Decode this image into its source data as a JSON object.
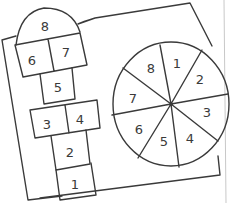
{
  "hopscotch": {
    "squares": [
      {
        "label": "1"
      },
      {
        "label": "2"
      },
      {
        "label": "3"
      },
      {
        "label": "4"
      },
      {
        "label": "5"
      },
      {
        "label": "6"
      },
      {
        "label": "7"
      },
      {
        "label": "8"
      }
    ]
  },
  "spinner": {
    "slices": [
      {
        "label": "1"
      },
      {
        "label": "2"
      },
      {
        "label": "3"
      },
      {
        "label": "4"
      },
      {
        "label": "5"
      },
      {
        "label": "6"
      },
      {
        "label": "7"
      },
      {
        "label": "8"
      }
    ]
  },
  "colors": {
    "ink": "#3a3a3a",
    "background": "#ffffff",
    "edge_line": "#c8c8c8"
  }
}
